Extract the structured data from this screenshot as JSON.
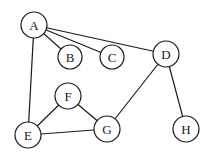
{
  "graph": {
    "nodes": [
      {
        "id": "A",
        "label": "A",
        "x": 34,
        "y": 25,
        "r": 13
      },
      {
        "id": "B",
        "label": "B",
        "x": 70,
        "y": 57,
        "r": 12
      },
      {
        "id": "C",
        "label": "C",
        "x": 112,
        "y": 57,
        "r": 12
      },
      {
        "id": "D",
        "label": "D",
        "x": 166,
        "y": 54,
        "r": 13
      },
      {
        "id": "F",
        "label": "F",
        "x": 68,
        "y": 96,
        "r": 13
      },
      {
        "id": "E",
        "label": "E",
        "x": 28,
        "y": 135,
        "r": 13
      },
      {
        "id": "G",
        "label": "G",
        "x": 107,
        "y": 129,
        "r": 13
      },
      {
        "id": "H",
        "label": "H",
        "x": 186,
        "y": 129,
        "r": 13
      }
    ],
    "edges": [
      [
        "A",
        "B"
      ],
      [
        "A",
        "C"
      ],
      [
        "A",
        "D"
      ],
      [
        "A",
        "E"
      ],
      [
        "D",
        "G"
      ],
      [
        "D",
        "H"
      ],
      [
        "E",
        "F"
      ],
      [
        "E",
        "G"
      ],
      [
        "F",
        "G"
      ]
    ]
  }
}
